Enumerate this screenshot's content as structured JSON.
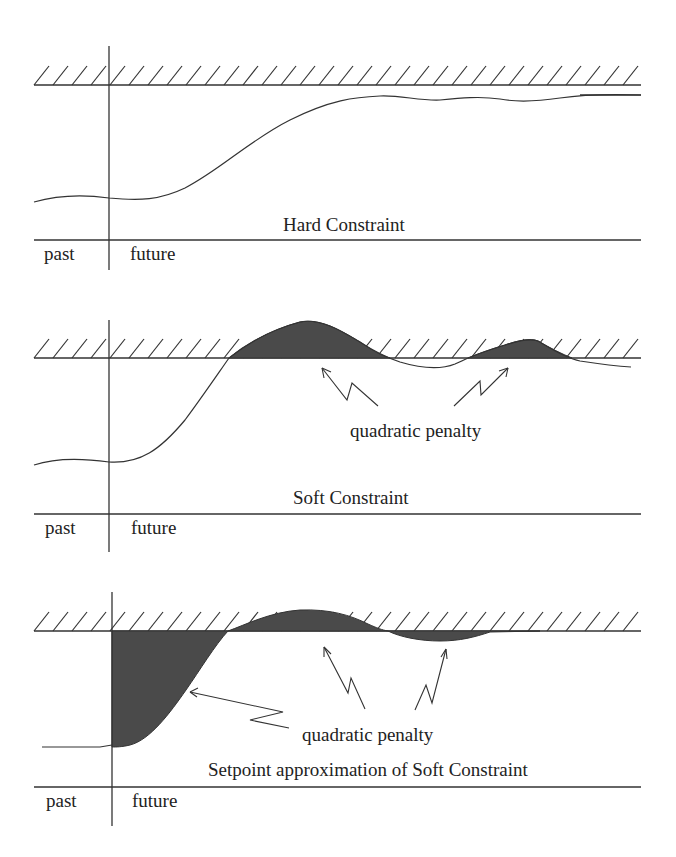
{
  "figure": {
    "colors": {
      "ink": "#333333",
      "penalty_fill": "#4a4a4a",
      "background": "#ffffff"
    },
    "panels": [
      {
        "id": "hard",
        "title": "Hard Constraint",
        "past_label": "past",
        "future_label": "future",
        "annotation": null
      },
      {
        "id": "soft",
        "title": "Soft Constraint",
        "past_label": "past",
        "future_label": "future",
        "annotation": "quadratic penalty"
      },
      {
        "id": "setpoint",
        "title": "Setpoint approximation of Soft Constraint",
        "past_label": "past",
        "future_label": "future",
        "annotation": "quadratic penalty"
      }
    ]
  }
}
